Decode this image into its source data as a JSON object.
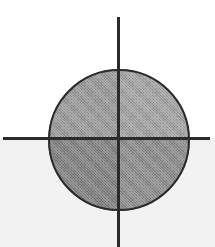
{
  "figure": {
    "canvas": {
      "width": 215,
      "height": 247,
      "background_upper": "#ffffff",
      "background_lower": "#f2f2f2"
    },
    "axes": {
      "color": "#2b2b2b",
      "x_axis": {
        "label": "x-axis",
        "orientation": "horizontal",
        "y_position": 138,
        "x_start": 3,
        "x_end": 210,
        "thickness": 3
      },
      "y_axis": {
        "label": "y-axis",
        "orientation": "vertical",
        "x_position": 117,
        "y_start": 17,
        "y_end": 247,
        "thickness": 3
      },
      "origin": {
        "label": "origin",
        "x": 118,
        "y": 139
      }
    },
    "circle": {
      "label": "shaded circle",
      "center_x": 119,
      "center_y": 140,
      "radius": 71,
      "outline_color": "#2b2b2b",
      "outline_width": 2,
      "quadrants": [
        {
          "name": "quadrant-i",
          "position": "upper-right",
          "fill": "#a3a3a3"
        },
        {
          "name": "quadrant-ii",
          "position": "upper-left",
          "fill": "#9a9a9a"
        },
        {
          "name": "quadrant-iii",
          "position": "lower-left",
          "fill": "#828282"
        },
        {
          "name": "quadrant-iv",
          "position": "lower-right",
          "fill": "#8d8d8d"
        }
      ]
    }
  },
  "chart_data": {
    "type": "scatter",
    "title": "",
    "xlabel": "",
    "ylabel": "",
    "grid": false,
    "legend": null,
    "annotations": [],
    "shapes": [
      {
        "type": "circle",
        "center": [
          0,
          0
        ],
        "radius": 1,
        "fill": "#989898",
        "edgecolor": "#2b2b2b",
        "linewidth": 2
      }
    ],
    "xlim": [
      -1.63,
      1.37
    ],
    "ylim": [
      -1.5,
      1.71
    ],
    "x": [
      0
    ],
    "y": [
      0
    ]
  }
}
